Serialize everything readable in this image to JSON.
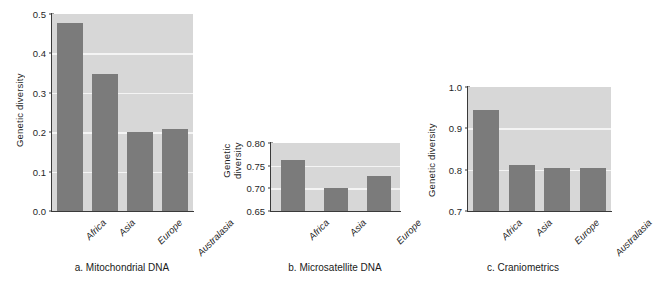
{
  "figure": {
    "background_color": "#ffffff",
    "bar_color": "#7b7b7b",
    "plot_background_color": "#d7d7d7",
    "gridline_color": "#f4f4f4",
    "axis_color": "#3a3a3a"
  },
  "chart_data": [
    {
      "type": "bar",
      "id": "mitochondrial-dna",
      "title": "a. Mitochondrial DNA",
      "xlabel": "",
      "ylabel": "Genetic diversity",
      "categories": [
        "Africa",
        "Asia",
        "Europe",
        "Australasia"
      ],
      "values": [
        0.478,
        0.348,
        0.2,
        0.209
      ],
      "ylim": [
        0.0,
        0.5
      ],
      "yticks": [
        0.0,
        0.1,
        0.2,
        0.3,
        0.4,
        0.5
      ],
      "ytick_labels": [
        "0.0",
        "0.1",
        "0.2",
        "0.3",
        "0.4",
        "0.5"
      ],
      "grid": true,
      "legend": "none"
    },
    {
      "type": "bar",
      "id": "microsatellite-dna",
      "title": "b. Microsatellite DNA",
      "xlabel": "",
      "ylabel": "Genetic diversity",
      "ylabel_lines": [
        "Genetic",
        "diversity"
      ],
      "categories": [
        "Africa",
        "Asia",
        "Europe"
      ],
      "values": [
        0.762,
        0.7,
        0.727
      ],
      "ylim": [
        0.65,
        0.8
      ],
      "yticks": [
        0.65,
        0.7,
        0.75,
        0.8
      ],
      "ytick_labels": [
        "0.65",
        "0.70",
        "0.75",
        "0.80"
      ],
      "grid": true,
      "legend": "none"
    },
    {
      "type": "bar",
      "id": "craniometrics",
      "title": "c. Craniometrics",
      "xlabel": "",
      "ylabel": "Genetic diversity",
      "categories": [
        "Africa",
        "Asia",
        "Europe",
        "Australasia"
      ],
      "values": [
        0.945,
        0.812,
        0.803,
        0.805
      ],
      "ylim": [
        0.7,
        1.0
      ],
      "yticks": [
        0.7,
        0.8,
        0.9,
        1.0
      ],
      "ytick_labels": [
        "0.7",
        "0.8",
        "0.9",
        "1.0"
      ],
      "grid": true,
      "legend": "none"
    }
  ]
}
